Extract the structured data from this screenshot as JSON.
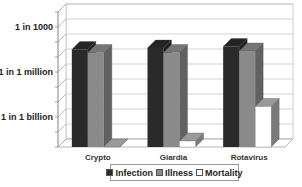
{
  "chart_data": {
    "type": "bar",
    "style": "3d-clustered-column",
    "title": "",
    "xlabel": "",
    "ylabel": "",
    "yscale": "log",
    "yticks": [
      {
        "label": "1 in 1000",
        "exponent": -3
      },
      {
        "label": "1 in 1 million",
        "exponent": -6
      },
      {
        "label": "1 in 1 billion",
        "exponent": -9
      }
    ],
    "ylim_exponent": [
      -11,
      -2
    ],
    "grid": true,
    "legend_position": "bottom",
    "categories": [
      "Crypto",
      "Giardia",
      "Rotavirus"
    ],
    "series": [
      {
        "name": "Infection",
        "color": "#2a2a2a",
        "exponents": [
          -4.5,
          -4.4,
          -4.3
        ]
      },
      {
        "name": "Illness",
        "color": "#8a8a8a",
        "exponents": [
          -4.7,
          -4.7,
          -4.6
        ]
      },
      {
        "name": "Mortality",
        "color": "#ffffff",
        "exponents": [
          -11,
          -10.6,
          -8.3
        ]
      }
    ]
  },
  "legend": {
    "items": [
      {
        "label": "Infection",
        "color": "#2a2a2a"
      },
      {
        "label": "Illness",
        "color": "#8a8a8a"
      },
      {
        "label": "Mortality",
        "color": "#ffffff"
      }
    ]
  }
}
